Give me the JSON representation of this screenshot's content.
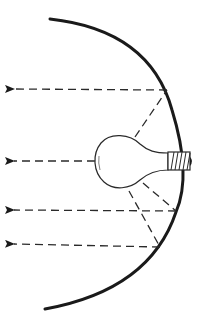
{
  "diagram": {
    "title": "Light bulb with curved reflector",
    "components": {
      "reflector": "curved-mirror",
      "source": "light-bulb",
      "socket": "threaded-base"
    },
    "rays": [
      {
        "id": "ray-1",
        "type": "reflected",
        "reflect_point": [
          167,
          90
        ],
        "exit_y": 89
      },
      {
        "id": "ray-2",
        "type": "direct",
        "exit_y": 161
      },
      {
        "id": "ray-3",
        "type": "reflected",
        "reflect_point": [
          176,
          211
        ],
        "exit_y": 210
      },
      {
        "id": "ray-4",
        "type": "reflected",
        "reflect_point": [
          160,
          247
        ],
        "exit_y": 244
      }
    ],
    "colors": {
      "stroke": "#1a1a1a",
      "background": "#ffffff"
    }
  }
}
